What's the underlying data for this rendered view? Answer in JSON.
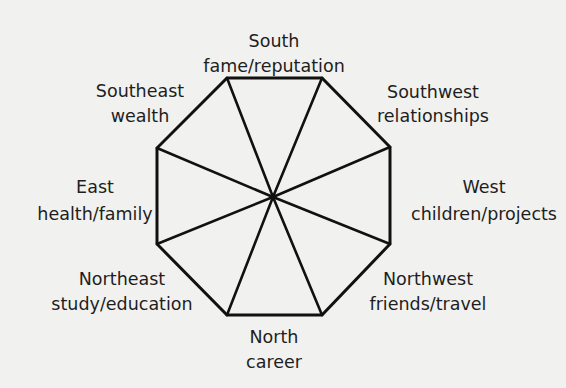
{
  "diagram": {
    "type": "bagua-octagon",
    "colors": {
      "background": "#f1f1ef",
      "line": "#111111",
      "text": "#1e1e1e"
    },
    "center": [
      273,
      197
    ],
    "vertices": [
      [
        227,
        78
      ],
      [
        322,
        78
      ],
      [
        390,
        147
      ],
      [
        390,
        244
      ],
      [
        322,
        315
      ],
      [
        227,
        315
      ],
      [
        157,
        244
      ],
      [
        157,
        148
      ]
    ],
    "sectors": [
      {
        "direction": "South",
        "area": "fame/reputation",
        "x": 274,
        "y1": 47,
        "y2": 72
      },
      {
        "direction": "Southwest",
        "area": "relationships",
        "x": 433,
        "y1": 98,
        "y2": 122
      },
      {
        "direction": "West",
        "area": "children/projects",
        "x": 484,
        "y1": 193,
        "y2": 220
      },
      {
        "direction": "Northwest",
        "area": "friends/travel",
        "x": 428,
        "y1": 285,
        "y2": 310
      },
      {
        "direction": "North",
        "area": "career",
        "x": 274,
        "y1": 343,
        "y2": 368
      },
      {
        "direction": "Northeast",
        "area": "study/education",
        "x": 122,
        "y1": 285,
        "y2": 310
      },
      {
        "direction": "East",
        "area": "health/family",
        "x": 95,
        "y1": 193,
        "y2": 220
      },
      {
        "direction": "Southeast",
        "area": "wealth",
        "x": 140,
        "y1": 97,
        "y2": 122
      }
    ]
  }
}
